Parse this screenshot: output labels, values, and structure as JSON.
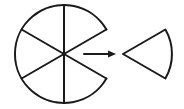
{
  "diagram": {
    "description": "Circle divided into 6 equal sectors with one sector removed, arrow pointing to the removed sector",
    "stroke_color": "#1a1a1a",
    "background": "#ffffff",
    "circle": {
      "sectors_total": 6,
      "sectors_remaining": 5,
      "center": [
        64,
        54
      ],
      "radius": 49
    },
    "arrow": {
      "direction": "right"
    },
    "removed_sector": {
      "count": 1,
      "angle_degrees": 60
    }
  }
}
